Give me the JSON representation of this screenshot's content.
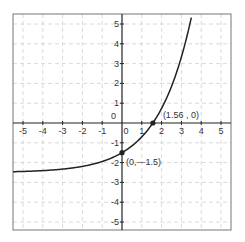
{
  "chart_data": {
    "type": "line",
    "title": "",
    "xlabel": "",
    "ylabel": "",
    "xlim": [
      -5.5,
      5.5
    ],
    "ylim": [
      -5.4,
      5.4
    ],
    "grid": true,
    "legend": null,
    "x_ticks": [
      -5,
      -4,
      -3,
      -2,
      -1,
      0,
      1,
      2,
      3,
      4,
      5
    ],
    "y_ticks": [
      -5,
      -4,
      -3,
      -2,
      -1,
      0,
      1,
      2,
      3,
      4,
      5
    ],
    "x_tick_labels": [
      "-5",
      "-4",
      "-3",
      "-2",
      "-1",
      "0",
      "1",
      "2",
      "3",
      "4",
      "5"
    ],
    "y_tick_labels": [
      "-5",
      "-4",
      "-3",
      "-2",
      "-1",
      "0",
      "1",
      "2",
      "3",
      "4",
      "5"
    ],
    "series": [
      {
        "name": "exponential curve",
        "description": "approx y = 1.8^x - 2.5, horizontal asymptote near y = -2.5",
        "x": [
          -5.5,
          -5,
          -4,
          -3,
          -2,
          -1,
          0,
          1,
          1.56,
          2,
          3,
          3.43
        ],
        "y": [
          -2.46,
          -2.45,
          -2.4,
          -2.33,
          -2.19,
          -1.94,
          -1.5,
          -0.7,
          0,
          0.74,
          3.33,
          5.0
        ]
      }
    ],
    "points": [
      {
        "x": 1.56,
        "y": 0,
        "label": "(1.56 , 0)"
      },
      {
        "x": 0,
        "y": -1.5,
        "label": "(0,—1.5)"
      }
    ]
  }
}
